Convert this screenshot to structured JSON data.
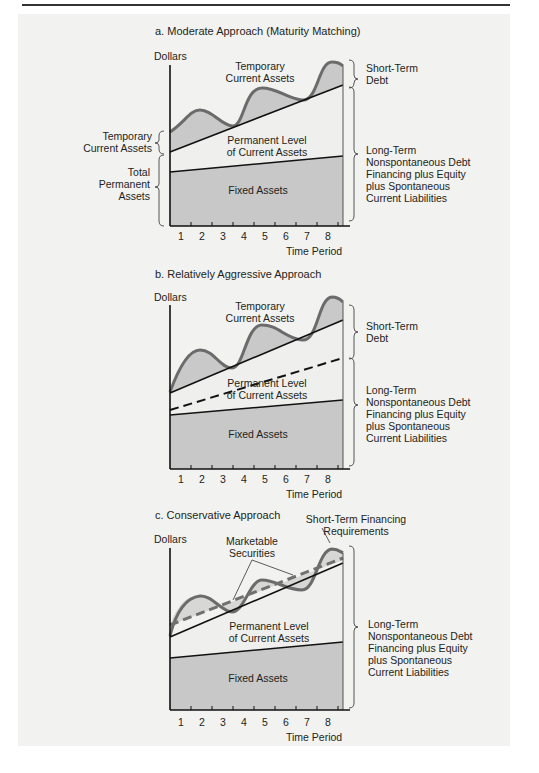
{
  "figure": {
    "header_fragment": "…Spending … Financing …",
    "panels": [
      {
        "title": "a. Moderate Approach (Maturity Matching)",
        "y_axis_label": "Dollars",
        "x_axis_label": "Time Period",
        "x_ticks": [
          "1",
          "2",
          "3",
          "4",
          "5",
          "6",
          "7",
          "8"
        ],
        "region_labels": {
          "temporary": [
            "Temporary",
            "Current Assets"
          ],
          "permanent": [
            "Permanent Level",
            "of Current Assets"
          ],
          "fixed": "Fixed Assets"
        },
        "left_braces": {
          "temporary": [
            "Temporary",
            "Current Assets"
          ],
          "total_permanent": [
            "Total",
            "Permanent",
            "Assets"
          ]
        },
        "right_braces": {
          "short_term": [
            "Short-Term",
            "Debt"
          ],
          "long_term": [
            "Long-Term",
            "Nonspontaneous Debt",
            "Financing plus Equity",
            "plus Spontaneous",
            "Current Liabilities"
          ]
        }
      },
      {
        "title": "b. Relatively Aggressive Approach",
        "y_axis_label": "Dollars",
        "x_axis_label": "Time Period",
        "x_ticks": [
          "1",
          "2",
          "3",
          "4",
          "5",
          "6",
          "7",
          "8"
        ],
        "region_labels": {
          "temporary": [
            "Temporary",
            "Current Assets"
          ],
          "permanent": [
            "Permanent Level",
            "of Current Assets"
          ],
          "fixed": "Fixed Assets"
        },
        "right_braces": {
          "short_term": [
            "Short-Term",
            "Debt"
          ],
          "long_term": [
            "Long-Term",
            "Nonspontaneous Debt",
            "Financing plus Equity",
            "plus Spontaneous",
            "Current Liabilities"
          ]
        }
      },
      {
        "title": "c. Conservative Approach",
        "y_axis_label": "Dollars",
        "x_axis_label": "Time Period",
        "x_ticks": [
          "1",
          "2",
          "3",
          "4",
          "5",
          "6",
          "7",
          "8"
        ],
        "region_labels": {
          "marketable": [
            "Marketable",
            "Securities"
          ],
          "short_term_req": [
            "Short-Term Financing",
            "Requirements"
          ],
          "permanent": [
            "Permanent Level",
            "of Current Assets"
          ],
          "fixed": "Fixed Assets"
        },
        "right_braces": {
          "long_term": [
            "Long-Term",
            "Nonspontaneous Debt",
            "Financing plus Equity",
            "plus Spontaneous",
            "Current Liabilities"
          ]
        }
      }
    ],
    "colors": {
      "background": "#f2f2f1",
      "fixed_fill": "#c8c8c8",
      "temporary_fill": "#c9c9c9",
      "permanent_fill": "#efefee",
      "wave_stroke": "#6b6b6b",
      "line": "#111111",
      "dash_c": "#707070"
    }
  }
}
